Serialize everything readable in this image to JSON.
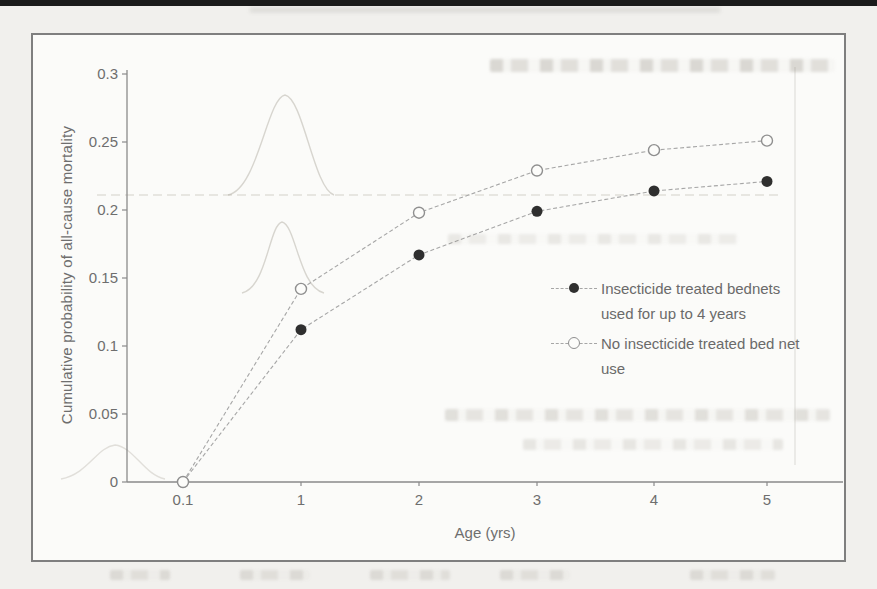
{
  "chart_data": {
    "type": "line",
    "title": "",
    "xlabel": "Age (yrs)",
    "ylabel": "Cumulative probability of all-cause mortality",
    "categories": [
      "0.1",
      "1",
      "2",
      "3",
      "4",
      "5"
    ],
    "x_tick_labels": [
      "0.1",
      "1",
      "2",
      "3",
      "4",
      "5"
    ],
    "y_tick_labels": [
      "0",
      "0.05",
      "0.1",
      "0.15",
      "0.2",
      "0.25",
      "0.3"
    ],
    "ylim": [
      0,
      0.3
    ],
    "grid": false,
    "legend_position": "middle-right",
    "series": [
      {
        "name": "Insecticide treated bednets used for up to 4 years",
        "marker": "filled-circle",
        "marker_color": "#2f2f2f",
        "marker_stroke": "#2f2f2f",
        "line_color": "#a6a6a6",
        "values": [
          0,
          0.112,
          0.167,
          0.199,
          0.214,
          0.221
        ]
      },
      {
        "name": "No insecticide treated bed net use",
        "marker": "open-circle",
        "marker_color": "#fcfcfa",
        "marker_stroke": "#8f8f8f",
        "line_color": "#a6a6a6",
        "values": [
          0,
          0.142,
          0.198,
          0.229,
          0.244,
          0.251
        ]
      }
    ]
  },
  "legend": {
    "items": [
      {
        "line1": "Insecticide treated bednets",
        "line2": "used for up to 4 years",
        "marker": "filled-circle"
      },
      {
        "line1": "No insecticide treated bed net",
        "line2": "use",
        "marker": "open-circle"
      }
    ]
  },
  "colors": {
    "axis": "#8a8a8a",
    "tick_text": "#6e6e6e",
    "page_bg": "#f1f0ed",
    "figure_bg": "#fbfbf9",
    "figure_border": "#7f7f7f",
    "top_rule": "#1b1b1b",
    "filled_marker": "#2f2f2f",
    "open_marker_stroke": "#8f8f8f",
    "series_line": "#a6a6a6"
  }
}
